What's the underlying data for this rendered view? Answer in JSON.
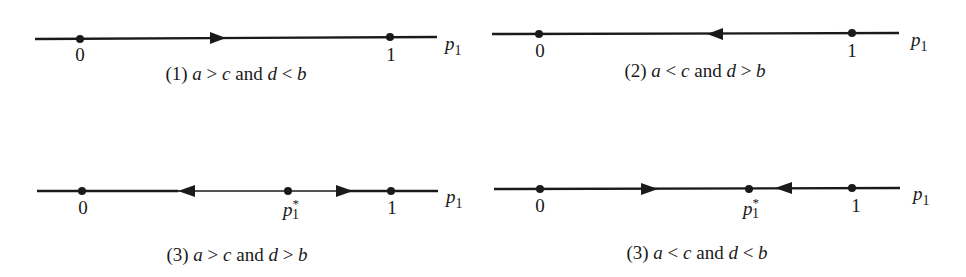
{
  "panels": [
    {
      "id": "1",
      "caption": {
        "prefix": "(1) ",
        "a": "a",
        "op1": " > ",
        "c": "c",
        "and": " and ",
        "d": "d",
        "op2": " < ",
        "b": "b"
      },
      "axis_label": {
        "main": "p",
        "sub": "1"
      },
      "points": [
        {
          "label": "0"
        },
        {
          "label": "1"
        }
      ],
      "arrows": [
        {
          "direction": "right",
          "position": "between 0 and 1"
        }
      ]
    },
    {
      "id": "2",
      "caption": {
        "prefix": "(2) ",
        "a": "a",
        "op1": " < ",
        "c": "c",
        "and": " and ",
        "d": "d",
        "op2": " > ",
        "b": "b"
      },
      "axis_label": {
        "main": "p",
        "sub": "1"
      },
      "points": [
        {
          "label": "0"
        },
        {
          "label": "1"
        }
      ],
      "arrows": [
        {
          "direction": "left",
          "position": "between 0 and 1"
        }
      ]
    },
    {
      "id": "3a",
      "caption": {
        "prefix": "(3) ",
        "a": "a",
        "op1": " > ",
        "c": "c",
        "and": " and ",
        "d": "d",
        "op2": " > ",
        "b": "b"
      },
      "axis_label": {
        "main": "p",
        "sub": "1"
      },
      "points": [
        {
          "label": "0"
        },
        {
          "label": "p",
          "sub": "1",
          "sup": "*"
        },
        {
          "label": "1"
        }
      ],
      "arrows": [
        {
          "direction": "left",
          "position": "between 0 and p1*"
        },
        {
          "direction": "right",
          "position": "between p1* and 1"
        }
      ]
    },
    {
      "id": "3b",
      "caption": {
        "prefix": "(3) ",
        "a": "a",
        "op1": " < ",
        "c": "c",
        "and": " and ",
        "d": "d",
        "op2": " < ",
        "b": "b"
      },
      "axis_label": {
        "main": "p",
        "sub": "1"
      },
      "points": [
        {
          "label": "0"
        },
        {
          "label": "p",
          "sub": "1",
          "sup": "*"
        },
        {
          "label": "1"
        }
      ],
      "arrows": [
        {
          "direction": "right",
          "position": "between 0 and p1*"
        },
        {
          "direction": "left",
          "position": "between p1* and 1"
        }
      ]
    }
  ]
}
